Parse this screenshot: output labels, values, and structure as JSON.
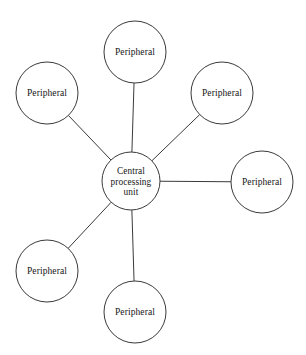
{
  "diagram": {
    "kind": "star-network-topology",
    "background_color": "#ffffff",
    "stroke_color": "#3a3a3c",
    "text_color": "#151515",
    "canvas": {
      "width": 306,
      "height": 355
    },
    "central_node": {
      "id": "central-processing-unit",
      "label_lines": [
        "Central",
        "processing",
        "unit"
      ],
      "label_line_1": "Central",
      "label_line_2": "processing",
      "label_line_3": "unit",
      "full_label": "Central processing unit",
      "cx": 131,
      "cy": 181,
      "r": 29
    },
    "peripheral_nodes": [
      {
        "id": "peripheral-top",
        "label": "Peripheral",
        "cx": 135,
        "cy": 52,
        "r": 31,
        "position": "top"
      },
      {
        "id": "peripheral-upper-left",
        "label": "Peripheral",
        "cx": 47,
        "cy": 93,
        "r": 31,
        "position": "upper-left"
      },
      {
        "id": "peripheral-upper-right",
        "label": "Peripheral",
        "cx": 222,
        "cy": 93,
        "r": 31,
        "position": "upper-right"
      },
      {
        "id": "peripheral-right",
        "label": "Peripheral",
        "cx": 262,
        "cy": 182,
        "r": 31,
        "position": "right"
      },
      {
        "id": "peripheral-lower-left",
        "label": "Peripheral",
        "cx": 47,
        "cy": 271,
        "r": 31,
        "position": "lower-left"
      },
      {
        "id": "peripheral-bottom",
        "label": "Peripheral",
        "cx": 135,
        "cy": 312,
        "r": 31,
        "position": "bottom"
      }
    ],
    "connections": [
      {
        "id": "link-top",
        "from": "central-processing-unit",
        "to": "peripheral-top"
      },
      {
        "id": "link-upper-left",
        "from": "central-processing-unit",
        "to": "peripheral-upper-left"
      },
      {
        "id": "link-upper-right",
        "from": "central-processing-unit",
        "to": "peripheral-upper-right"
      },
      {
        "id": "link-right",
        "from": "central-processing-unit",
        "to": "peripheral-right"
      },
      {
        "id": "link-lower-left",
        "from": "central-processing-unit",
        "to": "peripheral-lower-left"
      },
      {
        "id": "link-bottom",
        "from": "central-processing-unit",
        "to": "peripheral-bottom"
      }
    ]
  }
}
